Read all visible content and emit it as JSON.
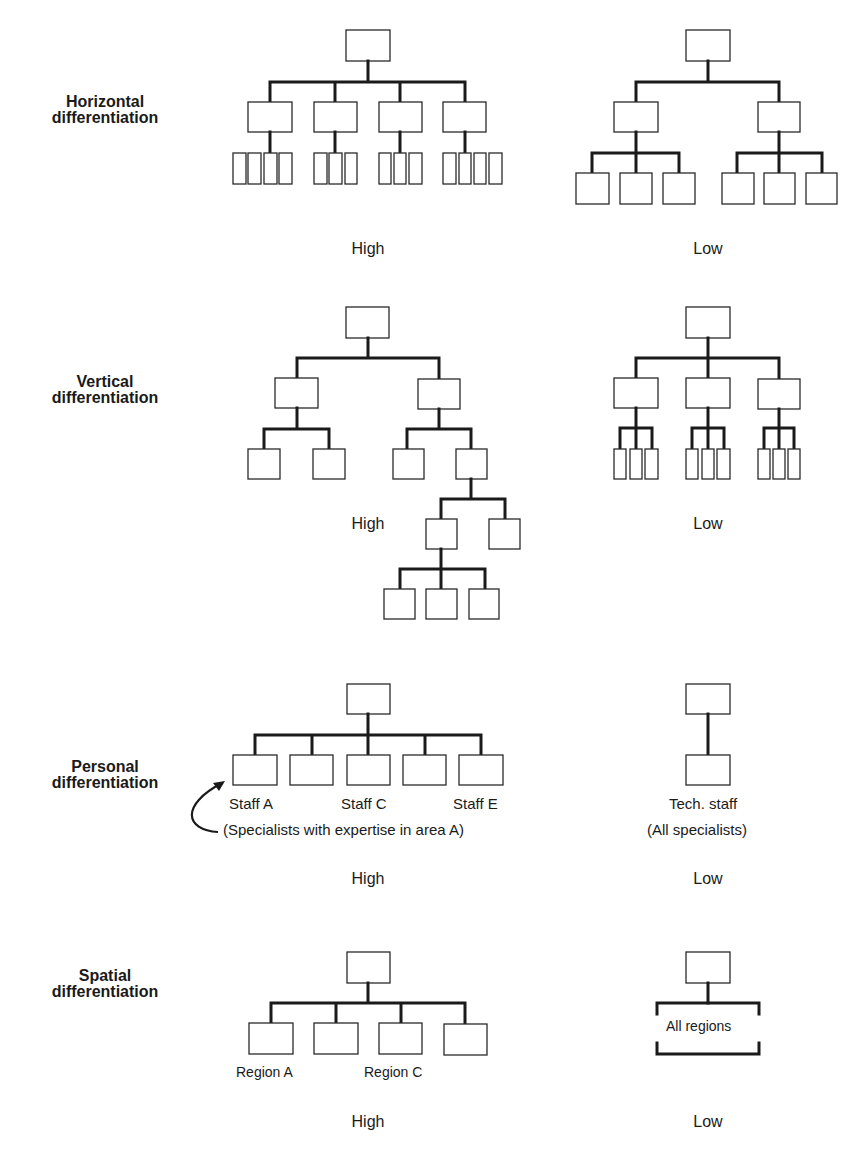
{
  "rows": [
    {
      "label_line1": "Horizontal",
      "label_line2": "differentiation",
      "high": "High",
      "low": "Low"
    },
    {
      "label_line1": "Vertical",
      "label_line2": "differentiation",
      "high": "High",
      "low": "Low"
    },
    {
      "label_line1": "Personal",
      "label_line2": "differentiation",
      "high": "High",
      "low": "Low"
    },
    {
      "label_line1": "Spatial",
      "label_line2": "differentiation",
      "high": "High",
      "low": "Low"
    }
  ],
  "personal": {
    "staff_a": "Staff A",
    "staff_c": "Staff C",
    "staff_e": "Staff E",
    "note": "(Specialists with expertise in area A)",
    "tech_staff": "Tech. staff",
    "all_specialists": "(All specialists)"
  },
  "spatial": {
    "region_a": "Region A",
    "region_c": "Region C",
    "all_regions": "All regions"
  },
  "colors": {
    "line": "#1a1a1a",
    "background": "#ffffff"
  }
}
